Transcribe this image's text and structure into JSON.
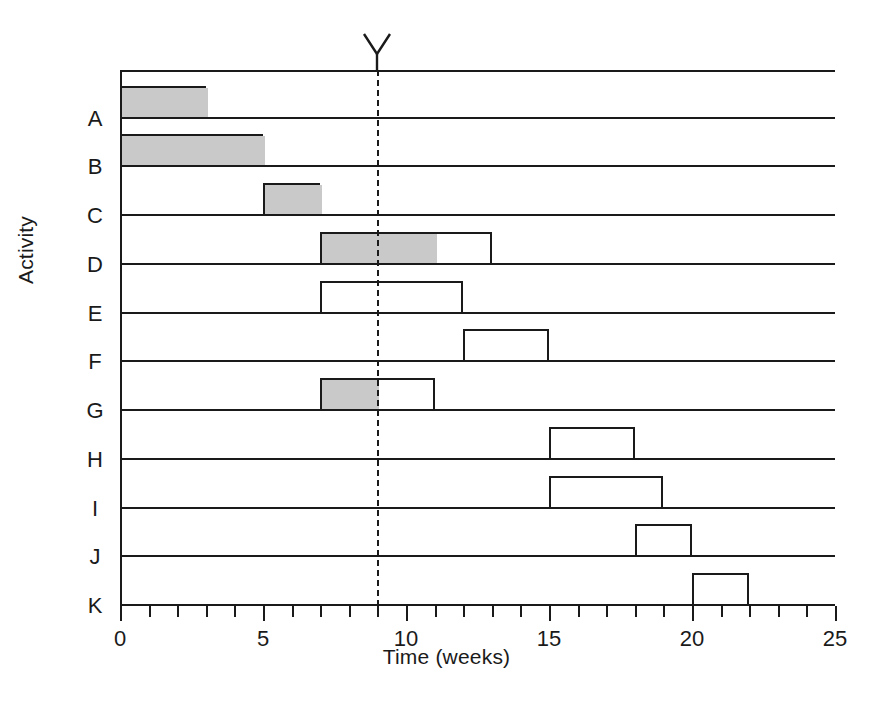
{
  "chart_data": {
    "type": "bar",
    "chart_variant": "gantt",
    "title": "",
    "xlabel": "Time (weeks)",
    "ylabel": "Activity",
    "xlim": [
      0,
      25
    ],
    "x_tick_labels": [
      "0",
      "5",
      "10",
      "15",
      "20",
      "25"
    ],
    "x_major_ticks": [
      0,
      5,
      10,
      15,
      20,
      25
    ],
    "x_minor_tick_interval": 1,
    "grid": false,
    "legend": null,
    "categories": [
      "A",
      "B",
      "C",
      "D",
      "E",
      "F",
      "G",
      "H",
      "I",
      "J",
      "K"
    ],
    "time_now": 9,
    "time_now_style": "dashed-vertical-line-with-v-marker",
    "bar_fill_shaded": "#c9c9c9",
    "bar_fill_open": "#ffffff",
    "bar_outline": "#1a1a1a",
    "tasks": [
      {
        "activity": "A",
        "start": 0,
        "end": 3,
        "progress_end": 3,
        "shaded": "full"
      },
      {
        "activity": "B",
        "start": 0,
        "end": 5,
        "progress_end": 5,
        "shaded": "full"
      },
      {
        "activity": "C",
        "start": 5,
        "end": 7,
        "progress_end": 7,
        "shaded": "full"
      },
      {
        "activity": "D",
        "start": 7,
        "end": 13,
        "progress_end": 11,
        "shaded": "partial"
      },
      {
        "activity": "E",
        "start": 7,
        "end": 12,
        "progress_end": 7,
        "shaded": "none"
      },
      {
        "activity": "F",
        "start": 12,
        "end": 15,
        "progress_end": 12,
        "shaded": "none"
      },
      {
        "activity": "G",
        "start": 7,
        "end": 11,
        "progress_end": 9,
        "shaded": "partial"
      },
      {
        "activity": "H",
        "start": 15,
        "end": 18,
        "progress_end": 15,
        "shaded": "none"
      },
      {
        "activity": "I",
        "start": 15,
        "end": 19,
        "progress_end": 15,
        "shaded": "none"
      },
      {
        "activity": "J",
        "start": 18,
        "end": 20,
        "progress_end": 18,
        "shaded": "none"
      },
      {
        "activity": "K",
        "start": 20,
        "end": 22,
        "progress_end": 20,
        "shaded": "none"
      }
    ]
  }
}
